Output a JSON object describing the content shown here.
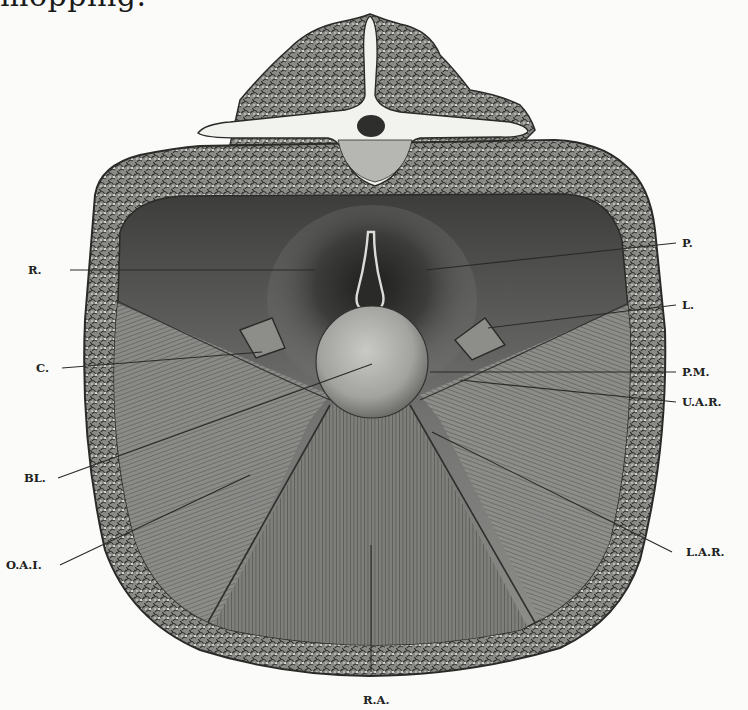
{
  "caption_fragment": "mopping.",
  "figure": {
    "labels": [
      {
        "key": "R",
        "text": "R."
      },
      {
        "key": "C",
        "text": "C."
      },
      {
        "key": "BL",
        "text": "BL."
      },
      {
        "key": "OAI",
        "text": "O.A.I."
      },
      {
        "key": "P",
        "text": "P."
      },
      {
        "key": "L",
        "text": "L."
      },
      {
        "key": "PM",
        "text": "P.M."
      },
      {
        "key": "UAR",
        "text": "U.A.R."
      },
      {
        "key": "LAR",
        "text": "L.A.R."
      },
      {
        "key": "RA",
        "text": "R.A."
      }
    ]
  },
  "colors": {
    "paper": "#fbfbf9",
    "ink": "#222222",
    "tissue_dark": "#4a4a48",
    "tissue_mid": "#7c7c7a",
    "tissue_light": "#a8a8a5",
    "bone": "#f2f2ee"
  }
}
